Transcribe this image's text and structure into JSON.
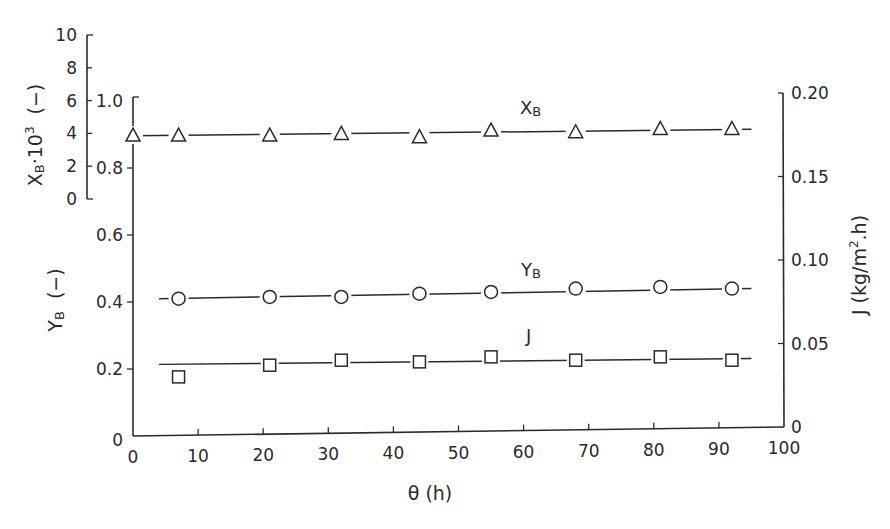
{
  "chart_data": {
    "type": "line",
    "title": "",
    "xlabel": "θ  (h)",
    "x_ticks": [
      0,
      10,
      20,
      30,
      40,
      50,
      60,
      70,
      80,
      90,
      100
    ],
    "xlim": [
      0,
      100
    ],
    "axes": {
      "left_lower": {
        "label": "YB  (−)",
        "ticks": [
          "0",
          "0.2",
          "0.4",
          "0.6",
          "0.8",
          "1.0"
        ],
        "range": [
          0,
          1.0
        ]
      },
      "left_upper": {
        "label": "XB·10³  (−)",
        "ticks": [
          "0",
          "2",
          "4",
          "6",
          "8",
          "10"
        ],
        "range": [
          0,
          10
        ]
      },
      "right": {
        "label": "J  (kg/m².h)",
        "ticks": [
          "0",
          "0.05",
          "0.10",
          "0.15",
          "0.20"
        ],
        "range": [
          0,
          0.2
        ]
      }
    },
    "grid": false,
    "legend": "inline labels",
    "series": [
      {
        "name": "XB",
        "marker": "triangle",
        "axis": "left_upper",
        "x": [
          0,
          7,
          21,
          32,
          44,
          55,
          68,
          81,
          92
        ],
        "values": [
          3.9,
          3.9,
          3.9,
          4.0,
          3.8,
          4.2,
          4.1,
          4.3,
          4.3
        ],
        "fit_line": {
          "x0": 0,
          "y0": 3.85,
          "x1": 95,
          "y1": 4.25
        }
      },
      {
        "name": "YB",
        "marker": "circle",
        "axis": "left_lower",
        "x": [
          7,
          21,
          32,
          44,
          55,
          68,
          81,
          92
        ],
        "values": [
          0.41,
          0.415,
          0.415,
          0.425,
          0.43,
          0.44,
          0.445,
          0.44
        ],
        "fit_line": {
          "x0": 4,
          "y0": 0.41,
          "x1": 95,
          "y1": 0.44
        }
      },
      {
        "name": "J",
        "marker": "square",
        "axis": "right",
        "x": [
          7,
          21,
          32,
          44,
          55,
          68,
          81,
          92
        ],
        "values": [
          0.03,
          0.037,
          0.04,
          0.039,
          0.042,
          0.04,
          0.042,
          0.04
        ],
        "fit_line": {
          "x0": 4,
          "y0": 0.0375,
          "x1": 95,
          "y1": 0.041
        }
      }
    ],
    "inline_labels": [
      {
        "text": "XB",
        "x": 55,
        "series": "XB"
      },
      {
        "text": "YB",
        "x": 55,
        "series": "YB"
      },
      {
        "text": "J",
        "x": 55,
        "series": "J"
      }
    ]
  },
  "labels": {
    "x_axis_title": "θ  (h)",
    "left_lower_title_main": "Y",
    "left_lower_title_sub": "B",
    "left_lower_title_unit": "(−)",
    "left_upper_title_main": "X",
    "left_upper_title_sub": "B",
    "left_upper_title_mult": "·10",
    "left_upper_title_exp": "3",
    "left_upper_title_unit": "(−)",
    "right_title": "J  (kg/m",
    "right_title_exp": "2",
    "right_title_end": ".h)",
    "series_xb_main": "X",
    "series_xb_sub": "B",
    "series_yb_main": "Y",
    "series_yb_sub": "B",
    "series_j": "J"
  }
}
